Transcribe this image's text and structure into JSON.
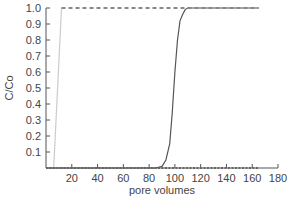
{
  "chart_data": {
    "type": "line",
    "title": "",
    "xlabel": "pore volumes",
    "ylabel": "C/Co",
    "xlim": [
      0,
      180
    ],
    "ylim": [
      0,
      1.0
    ],
    "xticks": [
      20,
      40,
      60,
      80,
      100,
      120,
      140,
      160,
      180
    ],
    "yticks": [
      0.1,
      0.2,
      0.3,
      0.4,
      0.5,
      0.6,
      0.7,
      0.8,
      0.9,
      1.0
    ],
    "grid": false,
    "legend": null,
    "series": [
      {
        "name": "breakthrough curve (solid dark)",
        "style": "solid",
        "color": "#555555",
        "x": [
          0,
          85,
          90,
          93,
          96,
          98,
          100,
          102,
          104,
          106,
          108,
          110,
          165
        ],
        "y": [
          0,
          0,
          0.01,
          0.05,
          0.15,
          0.35,
          0.6,
          0.8,
          0.92,
          0.96,
          0.99,
          1.0,
          1.0
        ]
      },
      {
        "name": "tracer (light gray)",
        "style": "solid",
        "color": "#cccccc",
        "x": [
          6,
          12
        ],
        "y": [
          0,
          1.0
        ]
      },
      {
        "name": "C/Co = 1 reference (dashed)",
        "style": "dashed",
        "color": "#888888",
        "x": [
          12,
          165
        ],
        "y": [
          1.0,
          1.0
        ]
      },
      {
        "name": "C/Co = 0 reference (dotted)",
        "style": "dotted",
        "color": "#666666",
        "x": [
          0,
          165
        ],
        "y": [
          0,
          0
        ]
      }
    ]
  }
}
